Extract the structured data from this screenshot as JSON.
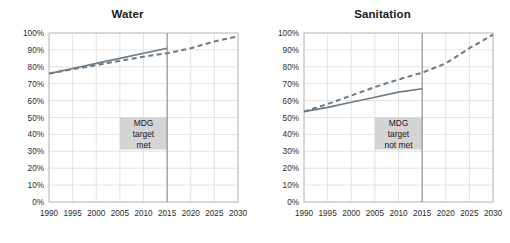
{
  "figure": {
    "background_color": "#ffffff",
    "panel_count": 2
  },
  "style": {
    "grid_color": "#d7d7d7",
    "axis_color": "#b5b5b5",
    "series_color": "#6e7b84",
    "target_line_color": "#6e7b84",
    "annotation_box_color": "#d4d4d4",
    "text_color": "#1a1a1a"
  },
  "chart_data": [
    {
      "type": "line",
      "title": "Water",
      "xlabel": "",
      "ylabel": "",
      "xlim": [
        1990,
        2030
      ],
      "ylim": [
        0,
        100
      ],
      "grid": true,
      "legend_position": "none",
      "xticks": [
        1990,
        1995,
        2000,
        2005,
        2010,
        2015,
        2020,
        2025,
        2030
      ],
      "xtick_labels": [
        "1990",
        "1995",
        "2000",
        "2005",
        "2010",
        "2015",
        "2020",
        "2025",
        "2030"
      ],
      "yticks": [
        0,
        10,
        20,
        30,
        40,
        50,
        60,
        70,
        80,
        90,
        100
      ],
      "ytick_labels": [
        "0%",
        "10%",
        "20%",
        "30%",
        "40%",
        "50%",
        "60%",
        "70%",
        "80%",
        "90%",
        "100%"
      ],
      "series": [
        {
          "name": "actual-coverage",
          "style": "solid",
          "x": [
            1990,
            1995,
            2000,
            2005,
            2010,
            2015
          ],
          "values": [
            76,
            79,
            82,
            85,
            88,
            91
          ]
        },
        {
          "name": "mdg-target-trajectory",
          "style": "dashed",
          "x": [
            1990,
            1995,
            2000,
            2005,
            2010,
            2015,
            2020,
            2025,
            2030
          ],
          "values": [
            76,
            78.5,
            81,
            83.5,
            86,
            88,
            91,
            95,
            98
          ]
        }
      ],
      "annotations": [
        {
          "name": "mdg-marker-line",
          "type": "vline",
          "x": 2015
        },
        {
          "name": "mdg-status-box",
          "type": "box",
          "x_range": [
            2005,
            2015
          ],
          "y_range": [
            31,
            50
          ],
          "lines": [
            "MDG",
            "target",
            "met"
          ]
        }
      ]
    },
    {
      "type": "line",
      "title": "Sanitation",
      "xlabel": "",
      "ylabel": "",
      "xlim": [
        1990,
        2030
      ],
      "ylim": [
        0,
        100
      ],
      "grid": true,
      "legend_position": "none",
      "xticks": [
        1990,
        1995,
        2000,
        2005,
        2010,
        2015,
        2020,
        2025,
        2030
      ],
      "xtick_labels": [
        "1990",
        "1995",
        "2000",
        "2005",
        "2010",
        "2015",
        "2020",
        "2025",
        "2030"
      ],
      "yticks": [
        0,
        10,
        20,
        30,
        40,
        50,
        60,
        70,
        80,
        90,
        100
      ],
      "ytick_labels": [
        "0%",
        "10%",
        "20%",
        "30%",
        "40%",
        "50%",
        "60%",
        "70%",
        "80%",
        "90%",
        "100%"
      ],
      "series": [
        {
          "name": "actual-coverage",
          "style": "solid",
          "x": [
            1990,
            1995,
            2000,
            2005,
            2010,
            2015
          ],
          "values": [
            53.5,
            56,
            59,
            62,
            65,
            67
          ]
        },
        {
          "name": "mdg-target-trajectory",
          "style": "dashed",
          "x": [
            1990,
            1995,
            2000,
            2005,
            2010,
            2015,
            2020,
            2025,
            2030
          ],
          "values": [
            53.5,
            58,
            63,
            68,
            72.5,
            76.5,
            82,
            91,
            99
          ]
        }
      ],
      "annotations": [
        {
          "name": "mdg-marker-line",
          "type": "vline",
          "x": 2015
        },
        {
          "name": "mdg-status-box",
          "type": "box",
          "x_range": [
            2005,
            2015
          ],
          "y_range": [
            31,
            50
          ],
          "lines": [
            "MDG",
            "target",
            "not met"
          ]
        }
      ]
    }
  ]
}
